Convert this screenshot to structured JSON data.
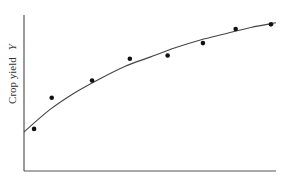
{
  "chart_data": {
    "type": "scatter",
    "title": "",
    "xlabel": "",
    "ylabel": "Crop yield",
    "ylabel_variable": "Y",
    "grid": false,
    "legend": null,
    "xlim": [
      0,
      10
    ],
    "ylim": [
      0,
      10
    ],
    "series": [
      {
        "name": "observations",
        "kind": "scatter",
        "x": [
          0.4,
          1.1,
          2.7,
          4.2,
          5.7,
          7.1,
          8.4,
          9.8
        ],
        "y": [
          2.7,
          4.7,
          5.8,
          7.2,
          7.4,
          8.2,
          9.1,
          9.4
        ]
      },
      {
        "name": "fitted curve",
        "kind": "line",
        "shape": "concave increasing (diminishing returns)",
        "x": [
          0,
          1,
          2,
          3,
          4,
          5,
          6,
          7,
          8,
          9,
          10
        ],
        "y": [
          2.5,
          3.9,
          5.0,
          5.9,
          6.7,
          7.3,
          7.9,
          8.4,
          8.8,
          9.2,
          9.5
        ]
      }
    ]
  },
  "colors": {
    "axis": "#555555",
    "curve": "#444444",
    "points": "#111111"
  }
}
